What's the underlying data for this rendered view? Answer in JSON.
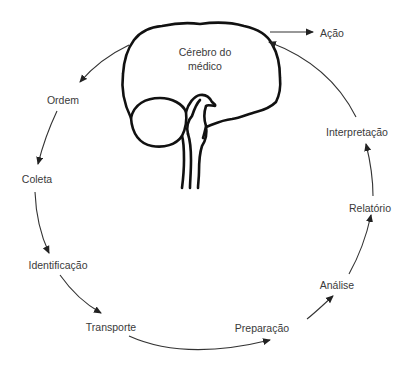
{
  "diagram": {
    "brain_label_line1": "Cérebro do",
    "brain_label_line2": "médico",
    "action_label": "Ação",
    "steps": [
      {
        "label": "Ordem"
      },
      {
        "label": "Coleta"
      },
      {
        "label": "Identificação"
      },
      {
        "label": "Transporte"
      },
      {
        "label": "Preparação"
      },
      {
        "label": "Análise"
      },
      {
        "label": "Relatório"
      },
      {
        "label": "Interpretação"
      }
    ],
    "colors": {
      "outline": "#111111",
      "arrow": "#333333",
      "text": "#3a3a3a",
      "background": "#ffffff"
    }
  }
}
